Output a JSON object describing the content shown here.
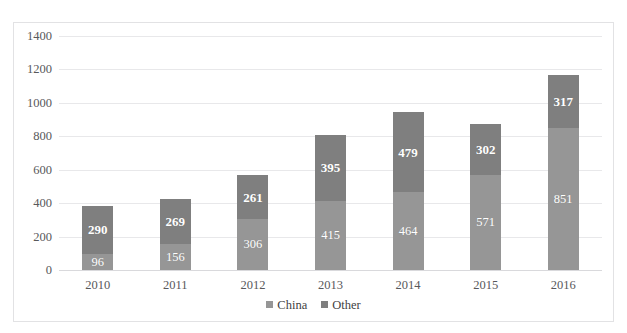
{
  "caption_clipped": "",
  "chart_data": {
    "type": "bar",
    "subtype": "stacked-bar",
    "title": "",
    "xlabel": "",
    "ylabel": "",
    "categories": [
      "2010",
      "2011",
      "2012",
      "2013",
      "2014",
      "2015",
      "2016"
    ],
    "series": [
      {
        "name": "China",
        "color": "#969696",
        "values": [
          96,
          156,
          306,
          415,
          464,
          571,
          851
        ]
      },
      {
        "name": "Other",
        "color": "#7f7f7f",
        "values": [
          290,
          269,
          261,
          395,
          479,
          302,
          317
        ]
      }
    ],
    "totals": [
      386,
      425,
      567,
      810,
      943,
      873,
      1168
    ],
    "ylim": [
      0,
      1400
    ],
    "ytick_step": 200,
    "ytick_labels": [
      "1400",
      "1200",
      "1000",
      "800",
      "600",
      "400",
      "200",
      "0"
    ],
    "ytick_values": [
      1400,
      1200,
      1000,
      800,
      600,
      400,
      200,
      0
    ],
    "grid": true,
    "grid_axis": "y",
    "legend_position": "bottom-center",
    "data_labels": true,
    "stack_order": [
      "China",
      "Other"
    ]
  },
  "legend": {
    "items": [
      {
        "label": "China",
        "color": "#969696"
      },
      {
        "label": "Other",
        "color": "#7f7f7f"
      }
    ]
  }
}
